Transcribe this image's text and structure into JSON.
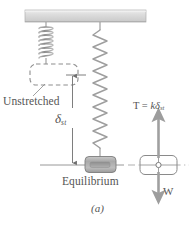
{
  "figure": {
    "caption": "(a)",
    "labels": {
      "unstretched": "Unstretched",
      "equilibrium": "Equilibrium",
      "deflection_symbol": "δ",
      "deflection_subscript": "st",
      "tension_prefix": "T = ",
      "tension_k": "k",
      "tension_delta": "δ",
      "tension_subscript": "st",
      "weight": "W"
    },
    "colors": {
      "line": "#8a8a8a",
      "text": "#555555",
      "ceiling_fill": "#d9d9d9",
      "ceiling_stroke": "#a8a8a8",
      "spring": "#9a9a9a",
      "block_fill": "#b5b5b5",
      "block_stroke": "#7d7d7d",
      "dashed_block": "#8e8e8e",
      "arrow": "#a0a0a0",
      "centerline": "#a6a6a6"
    },
    "parts": {
      "ceiling": "support-bar",
      "spring_unstretched": "coil-spring-unstretched",
      "spring_stretched": "zigzag-spring-stretched",
      "block_dashed": "dashed-block-unstretched-position",
      "block_solid": "shaded-block-equilibrium",
      "dimension": "static-deflection-dimension",
      "fbd_block": "free-body-block",
      "arrow_up": "tension-arrow-up",
      "arrow_down": "weight-arrow-down"
    }
  }
}
